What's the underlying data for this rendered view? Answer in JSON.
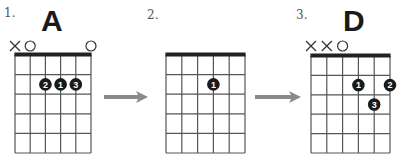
{
  "diagram": {
    "steps": [
      {
        "step_label": "1.",
        "chord_name": "A",
        "strings": 6,
        "frets": 5,
        "string_markers": [
          "X",
          "O",
          "",
          "",
          "",
          "O"
        ],
        "dots": [
          {
            "string": 3,
            "fret": 2,
            "finger": "2"
          },
          {
            "string": 4,
            "fret": 2,
            "finger": "1"
          },
          {
            "string": 5,
            "fret": 2,
            "finger": "3"
          }
        ]
      },
      {
        "step_label": "2.",
        "chord_name": "",
        "strings": 6,
        "frets": 5,
        "string_markers": [
          "",
          "",
          "",
          "",
          "",
          ""
        ],
        "dots": [
          {
            "string": 4,
            "fret": 2,
            "finger": "1"
          }
        ]
      },
      {
        "step_label": "3.",
        "chord_name": "D",
        "strings": 6,
        "frets": 5,
        "string_markers": [
          "X",
          "X",
          "O",
          "",
          "",
          ""
        ],
        "dots": [
          {
            "string": 4,
            "fret": 2,
            "finger": "1"
          },
          {
            "string": 6,
            "fret": 2,
            "finger": "2"
          },
          {
            "string": 5,
            "fret": 3,
            "finger": "3"
          }
        ]
      }
    ],
    "arrows": [
      {
        "from_step": 1,
        "to_step": 2
      },
      {
        "from_step": 2,
        "to_step": 3
      }
    ],
    "colors": {
      "grid_line": "#555555",
      "nut": "#222222",
      "dot_fill": "#1a1a1a",
      "dot_text": "#ffffff",
      "arrow": "#8a8a8a",
      "marker": "#333333"
    }
  }
}
